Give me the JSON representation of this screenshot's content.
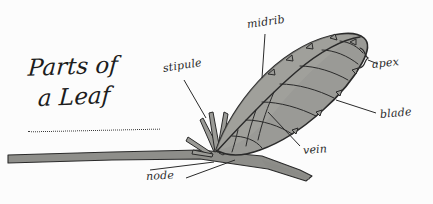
{
  "document": {
    "kind": "hand-drawn botanical diagram",
    "title_line_1": "Parts of",
    "title_line_2": "a Leaf",
    "background_color": "#fcfcfc",
    "ink_color": "#2b2b2b"
  },
  "palette": {
    "blade_fill": "#9a9a96",
    "blade_fill_light": "#a8a8a3",
    "stem_fill": "#8e8e8a",
    "outline": "#2a2a2a",
    "ink": "#2b2b2b",
    "paper": "#fcfcfc"
  },
  "labels": [
    {
      "id": "stipule",
      "text": "stipule",
      "points_to": "stipule-structure"
    },
    {
      "id": "midrib",
      "text": "midrib",
      "points_to": "midrib-line"
    },
    {
      "id": "apex",
      "text": "apex",
      "points_to": "leaf-apex"
    },
    {
      "id": "blade",
      "text": "blade",
      "points_to": "leaf-blade"
    },
    {
      "id": "vein",
      "text": "vein",
      "points_to": "leaf-vein"
    },
    {
      "id": "node",
      "text": "node",
      "points_to": "stem-node"
    }
  ],
  "parts": {
    "blade": "leaf-blade",
    "midrib": "midrib",
    "veins": "lateral-veins",
    "apex": "apex",
    "stipule": "stipule",
    "node": "node",
    "stem": "stem"
  }
}
